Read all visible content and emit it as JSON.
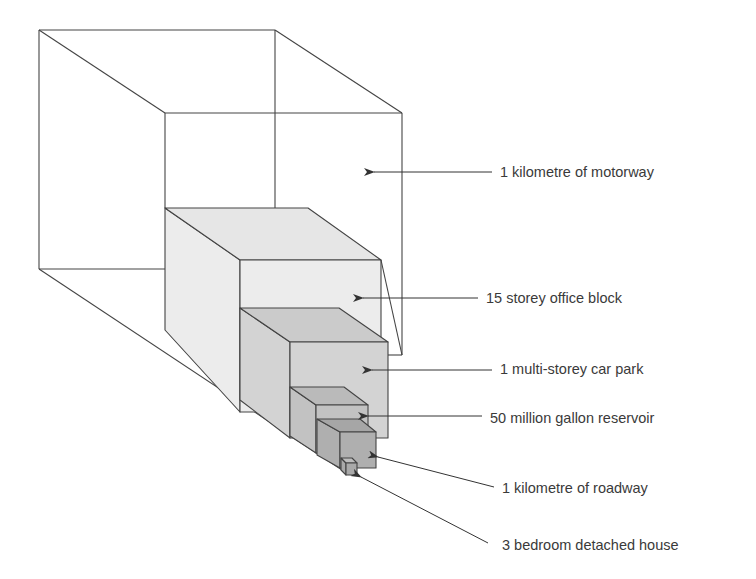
{
  "colors": {
    "stroke": "#444444",
    "background": "#ffffff",
    "motorway": "#ffffff",
    "office_block": "#ececec",
    "office_block_top": "#e6e6e6",
    "car_park": "#d3d3d3",
    "car_park_top": "#cbcbcb",
    "reservoir": "#c2c2c2",
    "reservoir_top": "#bababa",
    "roadway": "#afafaf",
    "roadway_top": "#a6a6a6",
    "house": "#a9a9a9",
    "house_top": "#bdbdbd",
    "text": "#3a3a3a"
  },
  "items": [
    {
      "id": "motorway",
      "label": "1 kilometre of motorway",
      "label_pos": [
        500,
        165
      ],
      "arrow": {
        "from": [
          492,
          172
        ],
        "to": [
          374,
          172
        ]
      },
      "box": {
        "back": [
          39,
          30,
          275,
          269
        ],
        "front": [
          165,
          113,
          402,
          355
        ]
      }
    },
    {
      "id": "office_block",
      "label": "15 storey office block",
      "label_pos": [
        486,
        291
      ],
      "arrow": {
        "from": [
          478,
          298
        ],
        "to": [
          363,
          298
        ]
      },
      "box": {
        "back": [
          165,
          208,
          308,
          330
        ],
        "front": [
          240,
          260,
          381,
          412
        ]
      }
    },
    {
      "id": "car_park",
      "label": "1 multi-storey car park",
      "label_pos": [
        500,
        362
      ],
      "arrow": {
        "from": [
          492,
          370
        ],
        "to": [
          372,
          370
        ]
      },
      "box": {
        "back": [
          240,
          308,
          339,
          400
        ],
        "front": [
          290,
          342,
          388,
          438
        ]
      }
    },
    {
      "id": "reservoir",
      "label": "50 million gallon reservoir",
      "label_pos": [
        490,
        411
      ],
      "arrow": {
        "from": [
          482,
          416
        ],
        "to": [
          368,
          416
        ]
      },
      "box": {
        "back": [
          290,
          387,
          344,
          436
        ],
        "front": [
          316,
          405,
          368,
          453
        ]
      }
    },
    {
      "id": "roadway",
      "label": "1 kilometre of roadway",
      "label_pos": [
        502,
        481
      ],
      "arrow": {
        "from": [
          494,
          487
        ],
        "to": [
          378,
          457
        ]
      },
      "box": {
        "back": [
          317,
          419,
          360,
          455
        ],
        "front": [
          340,
          432,
          376,
          468
        ]
      }
    },
    {
      "id": "house",
      "label": "3 bedroom detached house",
      "label_pos": [
        502,
        538
      ],
      "arrow": {
        "from": [
          488,
          543
        ],
        "to": [
          361,
          477
        ]
      },
      "box": {
        "back": [
          341,
          458,
          352,
          470
        ],
        "front": [
          346,
          463,
          357,
          475
        ]
      }
    }
  ]
}
